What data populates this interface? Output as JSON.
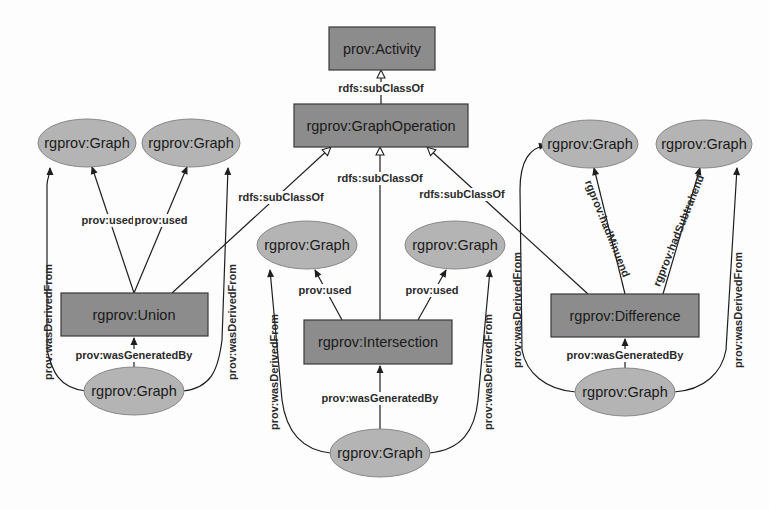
{
  "colors": {
    "class_box_fill": "#8c8c8c",
    "instance_ellipse_fill": "#b4b4b4",
    "edge": "#1e1e1e",
    "background": "#fdfdfd"
  },
  "nodes": {
    "activity": {
      "label": "prov:Activity",
      "shape": "rect"
    },
    "graph_operation": {
      "label": "rgprov:GraphOperation",
      "shape": "rect"
    },
    "union": {
      "label": "rgprov:Union",
      "shape": "rect"
    },
    "intersection": {
      "label": "rgprov:Intersection",
      "shape": "rect"
    },
    "difference": {
      "label": "rgprov:Difference",
      "shape": "rect"
    },
    "union_input_1": {
      "label": "rgprov:Graph",
      "shape": "ellipse"
    },
    "union_input_2": {
      "label": "rgprov:Graph",
      "shape": "ellipse"
    },
    "union_output": {
      "label": "rgprov:Graph",
      "shape": "ellipse"
    },
    "intersection_input_1": {
      "label": "rgprov:Graph",
      "shape": "ellipse"
    },
    "intersection_input_2": {
      "label": "rgprov:Graph",
      "shape": "ellipse"
    },
    "intersection_output": {
      "label": "rgprov:Graph",
      "shape": "ellipse"
    },
    "difference_minuend": {
      "label": "rgprov:Graph",
      "shape": "ellipse"
    },
    "difference_subtrahend": {
      "label": "rgprov:Graph",
      "shape": "ellipse"
    },
    "difference_output": {
      "label": "rgprov:Graph",
      "shape": "ellipse"
    }
  },
  "edges": {
    "graphop_subclass_activity": "rdfs:subClassOf",
    "union_subclass": "rdfs:subClassOf",
    "intersection_subclass": "rdfs:subClassOf",
    "difference_subclass": "rdfs:subClassOf",
    "union_used_1": "prov:used",
    "union_used_2": "prov:used",
    "union_generated": "prov:wasGeneratedBy",
    "union_derived_1": "prov:wasDerivedFrom",
    "union_derived_2": "prov:wasDerivedFrom",
    "intersection_used_1": "prov:used",
    "intersection_used_2": "prov:used",
    "intersection_generated": "prov:wasGeneratedBy",
    "intersection_derived_1": "prov:wasDerivedFrom",
    "intersection_derived_2": "prov:wasDerivedFrom",
    "difference_minuend": "rgprov:hadMinuend",
    "difference_subtrahend": "rgprov:hadSubtrahend",
    "difference_generated": "prov:wasGeneratedBy",
    "difference_derived_1": "prov:wasDerivedFrom",
    "difference_derived_2": "prov:wasDerivedFrom"
  }
}
